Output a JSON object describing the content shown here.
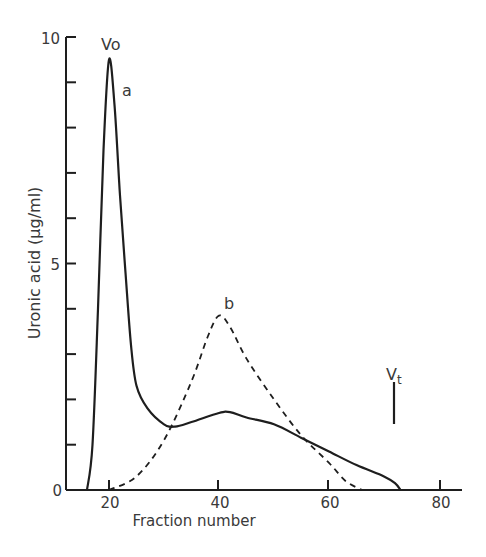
{
  "chart_data": {
    "type": "line",
    "title": "",
    "xlabel": "Fraction number",
    "ylabel": "Uronic acid  (µg/ml)",
    "xlim": [
      12,
      84
    ],
    "ylim": [
      0,
      10
    ],
    "x_ticks": [
      20,
      40,
      60,
      80
    ],
    "y_ticks_labeled": [
      0,
      5,
      10
    ],
    "y_minor_ticks": [
      1,
      2,
      3,
      4,
      6,
      7,
      8,
      9
    ],
    "grid": false,
    "legend": "none",
    "series": [
      {
        "name": "a",
        "style": "solid",
        "x": [
          16,
          17,
          18,
          19,
          20,
          21,
          22,
          23,
          24,
          25,
          27,
          30,
          32,
          35,
          40,
          42,
          45,
          50,
          55,
          60,
          65,
          70,
          72,
          73
        ],
        "values": [
          0,
          1.0,
          4.0,
          7.5,
          9.5,
          8.5,
          6.5,
          4.8,
          3.2,
          2.3,
          1.8,
          1.45,
          1.4,
          1.5,
          1.7,
          1.72,
          1.6,
          1.45,
          1.15,
          0.85,
          0.55,
          0.3,
          0.15,
          0
        ]
      },
      {
        "name": "b",
        "style": "dashed",
        "x": [
          20,
          25,
          30,
          35,
          38,
          40,
          42,
          45,
          50,
          55,
          60,
          63,
          66
        ],
        "values": [
          0,
          0.3,
          1.1,
          2.4,
          3.4,
          3.85,
          3.6,
          2.9,
          2.0,
          1.2,
          0.6,
          0.2,
          0
        ]
      }
    ],
    "annotations": [
      {
        "text": "Vo",
        "x": 20,
        "y": 10,
        "meaning": "void volume marker"
      },
      {
        "text": "a",
        "x": 22,
        "y": 8.8,
        "meaning": "curve a label"
      },
      {
        "text": "b",
        "x": 40,
        "y": 4.3,
        "meaning": "curve b label"
      },
      {
        "text": "Vt",
        "x": 72.5,
        "y": 2.4,
        "meaning": "total volume marker (vertical bar from ~1.5 to ~2.4)"
      }
    ]
  },
  "labels": {
    "xlabel": "Fraction number",
    "ylabel": "Uronic acid  (µg/ml)",
    "vo": "Vo",
    "vt_main": "V",
    "vt_sub": "t",
    "curve_a": "a",
    "curve_b": "b",
    "ytick_0": "0",
    "ytick_5": "5",
    "ytick_10": "10",
    "xtick_20": "20",
    "xtick_40": "40",
    "xtick_60": "60",
    "xtick_80": "80"
  },
  "colors": {
    "ink": "#1e1e1e",
    "text": "#3a3a3a",
    "background": "#ffffff"
  }
}
